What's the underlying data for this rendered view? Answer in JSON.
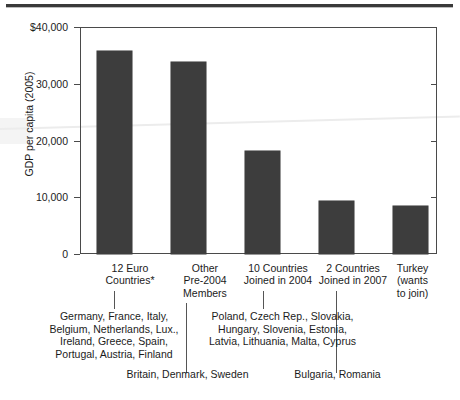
{
  "chart_data": {
    "type": "bar",
    "title": "",
    "xlabel": "",
    "ylabel": "GDP per capita (2005)",
    "ylim": [
      0,
      40000
    ],
    "grid": false,
    "legend": "none",
    "categories": [
      "12 Euro\nCountries*",
      "Other\nPre-2004\nMembers",
      "10 Countries\nJoined in 2004",
      "2 Countries\nJoined in 2007",
      "Turkey\n(wants\nto join)"
    ],
    "values": [
      35800,
      33800,
      18100,
      9300,
      8500
    ],
    "ytick_labels": [
      "$40,000",
      "30,000",
      "20,000",
      "10,000",
      "0"
    ],
    "ytick_values": [
      40000,
      30000,
      20000,
      10000,
      0
    ],
    "annotations": [
      "Germany, France, Italy,\nBelgium, Netherlands, Lux.,\nIreland, Greece, Spain,\nPortugal, Austria, Finland",
      "Britain, Denmark, Sweden",
      "Poland, Czech Rep., Slovakia,\nHungary, Slovenia, Estonia,\nLatvia, Lithuania, Malta, Cyprus",
      "Bulgaria, Romania"
    ],
    "colors": {
      "bar": "#3d3d3d",
      "axis": "#4a4a4a",
      "text": "#1b1b1b",
      "rule": "#3a3a3a"
    }
  },
  "axis": {
    "y_title": "GDP per capita (2005)",
    "ticks": [
      {
        "label": "$40,000"
      },
      {
        "label": "30,000"
      },
      {
        "label": "20,000"
      },
      {
        "label": "10,000"
      },
      {
        "label": "0"
      }
    ]
  },
  "categories": [
    {
      "label": "12 Euro\nCountries*"
    },
    {
      "label": "Other\nPre-2004\nMembers"
    },
    {
      "label": "10 Countries\nJoined in 2004"
    },
    {
      "label": "2 Countries\nJoined in 2007"
    },
    {
      "label": "Turkey\n(wants\nto join)"
    }
  ],
  "annotations": [
    {
      "text": "Germany, France, Italy,\nBelgium, Netherlands, Lux.,\nIreland, Greece, Spain,\nPortugal, Austria, Finland"
    },
    {
      "text": "Britain, Denmark, Sweden"
    },
    {
      "text": "Poland, Czech Rep., Slovakia,\nHungary, Slovenia, Estonia,\nLatvia, Lithuania, Malta, Cyprus"
    },
    {
      "text": "Bulgaria, Romania"
    }
  ]
}
